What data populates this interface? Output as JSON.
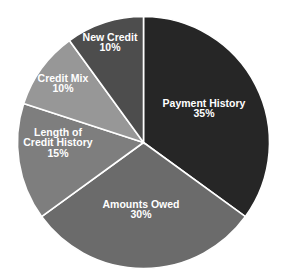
{
  "chart_data": {
    "type": "pie",
    "title": "",
    "start_angle_deg": -90,
    "direction": "clockwise",
    "center": [
      143.5,
      142.5
    ],
    "radius": 126,
    "legend": "none (labels inside slices)",
    "slices": [
      {
        "label": "Payment History",
        "value": 35,
        "value_label": "35%",
        "color": "#262626",
        "label_lines": [
          "Payment History",
          "35%"
        ],
        "label_pos": [
          204,
          112
        ]
      },
      {
        "label": "Amounts Owed",
        "value": 30,
        "value_label": "30%",
        "color": "#6b6b6b",
        "label_lines": [
          "Amounts Owed",
          "30%"
        ],
        "label_pos": [
          141,
          213
        ]
      },
      {
        "label": "Length of Credit History",
        "value": 15,
        "value_label": "15%",
        "color": "#7e7e7e",
        "label_lines": [
          "Length of",
          "Credit History",
          "15%"
        ],
        "label_pos": [
          58,
          146
        ]
      },
      {
        "label": "Credit Mix",
        "value": 10,
        "value_label": "10%",
        "color": "#979797",
        "label_lines": [
          "Credit Mix",
          "10%"
        ],
        "label_pos": [
          63,
          87
        ]
      },
      {
        "label": "New Credit",
        "value": 10,
        "value_label": "10%",
        "color": "#4d4d4d",
        "label_lines": [
          "New Credit",
          "10%"
        ],
        "label_pos": [
          110,
          46
        ]
      }
    ]
  }
}
